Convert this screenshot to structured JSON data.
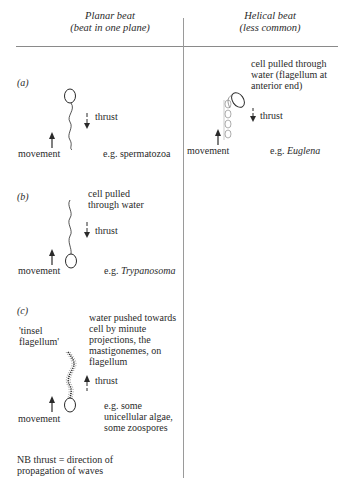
{
  "columns": [
    {
      "title": "Planar beat",
      "subtitle": "(beat in one plane)"
    },
    {
      "title": "Helical beat",
      "subtitle": "(less common)"
    }
  ],
  "panels": {
    "a": {
      "label": "(a)",
      "thrust_label": "thrust",
      "movement_label": "movement",
      "example_prefix": "e.g. ",
      "example": "spermatozoa"
    },
    "helical": {
      "description": [
        "cell pulled through",
        "water (flagellum at",
        "anterior end)"
      ],
      "thrust_label": "thrust",
      "movement_label": "movement",
      "example_prefix": "e.g. ",
      "example": "Euglena"
    },
    "b": {
      "label": "(b)",
      "description": [
        "cell pulled",
        "through water"
      ],
      "thrust_label": "thrust",
      "movement_label": "movement",
      "example_prefix": "e.g. ",
      "example": "Trypanosoma"
    },
    "c": {
      "label": "(c)",
      "tinsel_label": [
        "'tinsel",
        "flagellum'"
      ],
      "description": [
        "water pushed towards",
        "cell by minute",
        "projections, the",
        "mastigonemes, on",
        "flagellum"
      ],
      "thrust_label": "thrust",
      "movement_label": "movement",
      "example": [
        "e.g. some",
        "unicellular algae,",
        "some zoospores"
      ]
    }
  },
  "note": [
    "NB thrust = direction of",
    "propagation of waves"
  ],
  "colors": {
    "ink": "#2a2a2a",
    "rule": "#8a8a8a"
  }
}
